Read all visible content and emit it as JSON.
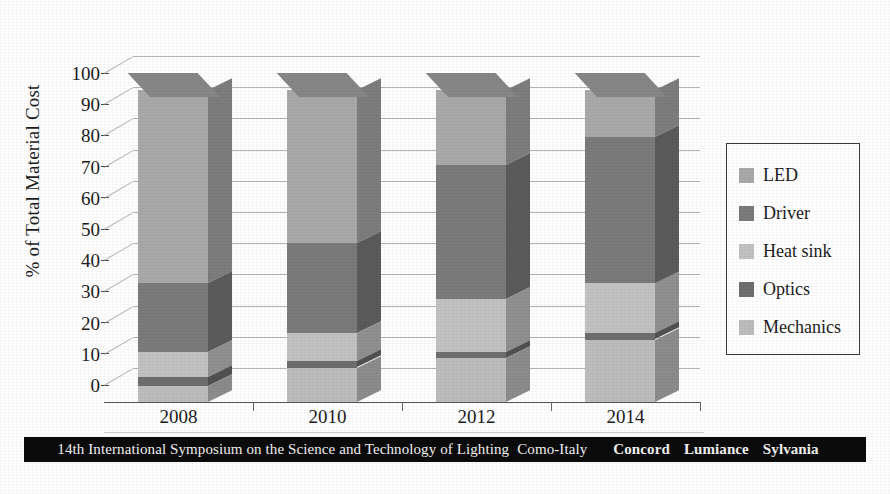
{
  "chart_data": {
    "type": "bar",
    "subtype": "stacked-column-3d",
    "title": "",
    "xlabel": "",
    "ylabel": "% of Total Material Cost",
    "ylim": [
      0,
      100
    ],
    "yticks": [
      0,
      10,
      20,
      30,
      40,
      50,
      60,
      70,
      80,
      90,
      100
    ],
    "grid": true,
    "legend_position": "right",
    "categories": [
      "2008",
      "2010",
      "2012",
      "2014"
    ],
    "stack_order_bottom_to_top": [
      "Mechanics",
      "Optics",
      "Heat sink",
      "Driver",
      "LED"
    ],
    "series": [
      {
        "name": "LED",
        "values": [
          62,
          49,
          24,
          15
        ],
        "color": "#a9a9a9"
      },
      {
        "name": "Driver",
        "values": [
          22,
          29,
          43,
          47
        ],
        "color": "#7b7b7b"
      },
      {
        "name": "Heat sink",
        "values": [
          8,
          9,
          17,
          16
        ],
        "color": "#c2c2c2"
      },
      {
        "name": "Optics",
        "values": [
          3,
          2,
          2,
          2
        ],
        "color": "#6e6e6e"
      },
      {
        "name": "Mechanics",
        "values": [
          5,
          11,
          14,
          20
        ],
        "color": "#bdbdbd"
      }
    ],
    "totals": [
      100,
      100,
      100,
      100
    ]
  },
  "axis": {
    "y_label": "% of Total Material Cost",
    "y_tick_labels": [
      "100",
      "90",
      "80",
      "70",
      "60",
      "50",
      "40",
      "30",
      "20",
      "10",
      "0"
    ],
    "x_tick_labels": [
      "2008",
      "2010",
      "2012",
      "2014"
    ]
  },
  "legend": {
    "items": [
      {
        "label": "LED",
        "color": "#a9a9a9",
        "swatch_name": "legend-swatch-led"
      },
      {
        "label": "Driver",
        "color": "#7b7b7b",
        "swatch_name": "legend-swatch-driver"
      },
      {
        "label": "Heat sink",
        "color": "#c2c2c2",
        "swatch_name": "legend-swatch-heat-sink"
      },
      {
        "label": "Optics",
        "color": "#6e6e6e",
        "swatch_name": "legend-swatch-optics"
      },
      {
        "label": "Mechanics",
        "color": "#bdbdbd",
        "swatch_name": "legend-swatch-mechanics"
      }
    ]
  },
  "footer": {
    "conference": "14th International Symposium on the Science and Technology of Lighting",
    "location": "Como-Italy",
    "brands": [
      "Concord",
      "Lumiance",
      "Sylvania"
    ],
    "background": "#0b0b0b",
    "text_color": "#f2f2f2"
  }
}
